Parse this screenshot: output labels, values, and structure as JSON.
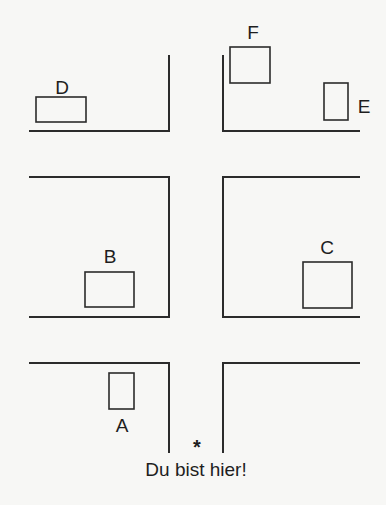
{
  "diagram": {
    "type": "street-map",
    "colors": {
      "background": "#f7f7f5",
      "ink": "#2b2b2b"
    },
    "buildings": [
      {
        "id": "D",
        "label": "D",
        "x": 36,
        "y": 97,
        "w": 50,
        "h": 25,
        "label_x": 62,
        "label_y": 87
      },
      {
        "id": "F",
        "label": "F",
        "x": 230,
        "y": 47,
        "w": 40,
        "h": 36,
        "label_x": 253,
        "label_y": 32
      },
      {
        "id": "E",
        "label": "E",
        "x": 324,
        "y": 83,
        "w": 24,
        "h": 37,
        "label_x": 364,
        "label_y": 106
      },
      {
        "id": "B",
        "label": "B",
        "x": 85,
        "y": 272,
        "w": 49,
        "h": 35,
        "label_x": 110,
        "label_y": 256
      },
      {
        "id": "C",
        "label": "C",
        "x": 303,
        "y": 262,
        "w": 49,
        "h": 46,
        "label_x": 327,
        "label_y": 247
      },
      {
        "id": "A",
        "label": "A",
        "x": 109,
        "y": 373,
        "w": 25,
        "h": 36,
        "label_x": 122,
        "label_y": 425
      }
    ],
    "you_are_here": {
      "marker": "*",
      "text": "Du bist hier!"
    }
  }
}
